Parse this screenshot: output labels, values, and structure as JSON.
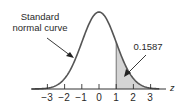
{
  "chart_data": {
    "type": "area",
    "title": "",
    "xlabel": "z",
    "ylabel": "",
    "xlim": [
      -3.5,
      3.5
    ],
    "ticks": [
      "−3",
      "−2",
      "−1",
      "0",
      "1",
      "2",
      "3"
    ],
    "tick_values": [
      -3,
      -2,
      -1,
      0,
      1,
      2,
      3
    ],
    "grid": false,
    "legend": null,
    "series": [
      {
        "name": "Standard normal curve",
        "function": "standard normal density",
        "mean": 0,
        "sd": 1
      }
    ],
    "shaded_region": {
      "from": 1,
      "to": 3.5,
      "area": 0.1587,
      "color": "#d4d4d4"
    },
    "annotations": [
      {
        "text_lines": [
          "Standard",
          "normal curve"
        ],
        "points_to": "curve at z≈-1.5"
      },
      {
        "text": "0.1587",
        "points_to": "shaded tail z>1"
      }
    ]
  },
  "labels": {
    "curve_line1": "Standard",
    "curve_line2": "normal curve",
    "area_value": "0.1587",
    "axis_var": "z",
    "ticks": [
      "−3",
      "−2",
      "−1",
      "0",
      "1",
      "2",
      "3"
    ]
  },
  "colors": {
    "curve": "#555555",
    "shade": "#d4d4d4",
    "axis": "#333333",
    "text": "#2a2a2a"
  }
}
